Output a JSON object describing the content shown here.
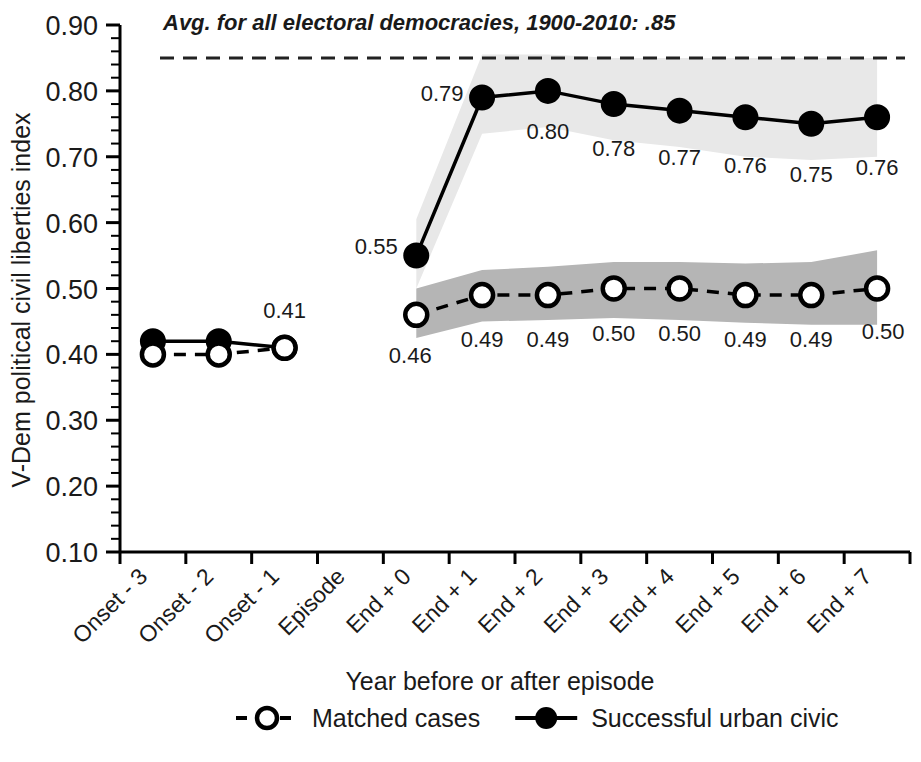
{
  "chart_data": {
    "type": "line",
    "title": "",
    "xlabel": "Year before or after episode",
    "ylabel": "V-Dem political civil liberties index",
    "ylim": [
      0.1,
      0.9
    ],
    "ytick_labels": [
      "0.90",
      "0.80",
      "0.70",
      "0.60",
      "0.50",
      "0.40",
      "0.30",
      "0.20",
      "0.10"
    ],
    "ytick_values": [
      0.9,
      0.8,
      0.7,
      0.6,
      0.5,
      0.4,
      0.3,
      0.2,
      0.1
    ],
    "yminor_step": 0.02,
    "grid": false,
    "legend_position": "bottom",
    "categories": [
      "Onset - 3",
      "Onset - 2",
      "Onset - 1",
      "Episode",
      "End + 0",
      "End + 1",
      "End + 2",
      "End + 3",
      "End + 4",
      "End + 5",
      "End + 6",
      "End + 7"
    ],
    "annotation": {
      "text": "Avg. for all electoral democracies, 1900-2010: .85",
      "reference_value": 0.85,
      "style": "dashed-horizontal-line"
    },
    "series": [
      {
        "name": "Successful urban civic",
        "marker": "filled-circle",
        "line": "solid",
        "color": "#000000",
        "band_color": "#e8e8e8",
        "values": [
          0.42,
          0.42,
          0.41,
          null,
          0.55,
          0.79,
          0.8,
          0.78,
          0.77,
          0.76,
          0.75,
          0.76
        ],
        "labels": [
          "",
          "",
          "0.41",
          "",
          "0.55",
          "0.79",
          "0.80",
          "0.78",
          "0.77",
          "0.76",
          "0.75",
          "0.76"
        ],
        "band_lower": [
          null,
          null,
          null,
          null,
          0.5,
          0.735,
          0.745,
          0.725,
          0.715,
          0.7,
          0.695,
          0.7
        ],
        "band_upper": [
          null,
          null,
          null,
          null,
          0.605,
          0.855,
          0.855,
          0.85,
          0.85,
          0.85,
          0.85,
          0.85
        ]
      },
      {
        "name": "Matched cases",
        "marker": "open-circle",
        "line": "dashed",
        "color": "#000000",
        "band_color": "#b5b5b5",
        "values": [
          0.4,
          0.4,
          0.41,
          null,
          0.46,
          0.49,
          0.49,
          0.5,
          0.5,
          0.49,
          0.49,
          0.5
        ],
        "labels": [
          "",
          "",
          "",
          "",
          "0.46",
          "0.49",
          "0.49",
          "0.50",
          "0.50",
          "0.49",
          "0.49",
          "0.50"
        ],
        "band_lower": [
          null,
          null,
          null,
          null,
          0.425,
          0.45,
          0.452,
          0.455,
          0.452,
          0.448,
          0.445,
          0.445
        ],
        "band_upper": [
          null,
          null,
          null,
          null,
          0.5,
          0.528,
          0.533,
          0.54,
          0.54,
          0.538,
          0.54,
          0.558
        ]
      }
    ]
  },
  "legend": {
    "items": [
      {
        "label": "Matched cases",
        "marker": "open-circle",
        "line": "dashed"
      },
      {
        "label": "Successful urban civic",
        "marker": "filled-circle",
        "line": "solid"
      }
    ]
  }
}
